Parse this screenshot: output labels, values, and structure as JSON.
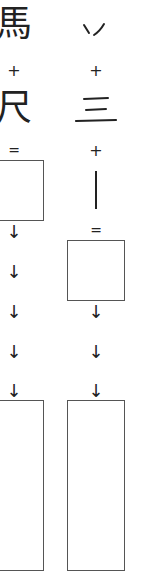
{
  "left": {
    "component_1": "馬",
    "plus": "+",
    "component_2": "尺",
    "equals": "=",
    "arrows": [
      "↓",
      "↓",
      "↓",
      "↓",
      "↓"
    ]
  },
  "right": {
    "component_1": "ソ",
    "plus_1": "+",
    "component_2": "三",
    "plus_2": "+",
    "component_3": "丨",
    "equals": "=",
    "arrows": [
      "↓",
      "↓",
      "↓"
    ]
  }
}
